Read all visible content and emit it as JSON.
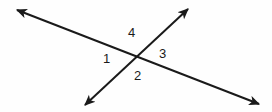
{
  "figure": {
    "name": "two-intersecting-lines-angle-diagram",
    "background_color": "#fefefe",
    "stroke_color": "#1a1a1a",
    "stroke_width": 2,
    "width": 272,
    "height": 112,
    "intersection": {
      "x": 137,
      "y": 56
    }
  },
  "lines": [
    {
      "id": "line-shallow",
      "name": "line-northwest-southeast",
      "from": {
        "x": 17,
        "y": 10
      },
      "to": {
        "x": 259,
        "y": 104
      },
      "arrowheads": "both"
    },
    {
      "id": "line-steep",
      "name": "line-southwest-northeast",
      "from": {
        "x": 85,
        "y": 105
      },
      "to": {
        "x": 188,
        "y": 9
      },
      "arrowheads": "both"
    }
  ],
  "labels": [
    {
      "id": "angle-4",
      "text": "4",
      "x": 128,
      "y": 26,
      "position": "top"
    },
    {
      "id": "angle-1",
      "text": "1",
      "x": 103,
      "y": 52,
      "position": "left"
    },
    {
      "id": "angle-3",
      "text": "3",
      "x": 159,
      "y": 47,
      "position": "right"
    },
    {
      "id": "angle-2",
      "text": "2",
      "x": 134,
      "y": 69,
      "position": "bottom"
    }
  ]
}
